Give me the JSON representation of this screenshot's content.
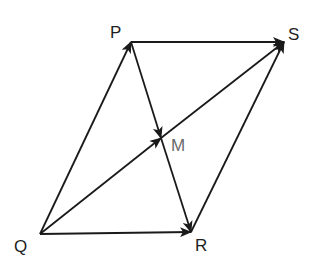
{
  "diagram": {
    "type": "vector parallelogram",
    "line_color": "#1a1a1a",
    "label_color": "#1e1e1e",
    "muted_label_color": "#6a6a6a",
    "points": {
      "P": {
        "label": "P",
        "x": 131,
        "y": 42
      },
      "S": {
        "label": "S",
        "x": 284,
        "y": 42
      },
      "Q": {
        "label": "Q",
        "x": 40,
        "y": 234
      },
      "R": {
        "label": "R",
        "x": 191,
        "y": 232
      },
      "M": {
        "label": "M",
        "x": 161,
        "y": 138
      }
    },
    "vectors": [
      {
        "from": "Q",
        "to": "P"
      },
      {
        "from": "P",
        "to": "S"
      },
      {
        "from": "Q",
        "to": "R"
      },
      {
        "from": "R",
        "to": "S"
      },
      {
        "from": "Q",
        "to": "M"
      },
      {
        "from": "M",
        "to": "S"
      },
      {
        "from": "P",
        "to": "M"
      },
      {
        "from": "M",
        "to": "R"
      }
    ]
  }
}
